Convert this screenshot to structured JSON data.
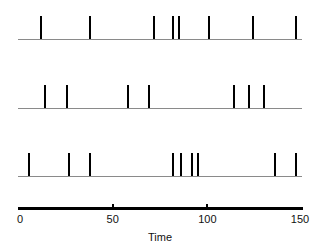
{
  "chart_data": {
    "type": "scatter",
    "plot_style": "raster / spike train",
    "title": "",
    "xlabel": "Time",
    "ylabel": "",
    "xlim": [
      0,
      150
    ],
    "xticks": [
      0,
      50,
      100,
      150
    ],
    "xticklabels": [
      "0",
      "50",
      "100",
      "150"
    ],
    "grid": false,
    "legend": null,
    "series": [
      {
        "name": "Trial 1",
        "row": 1,
        "values": [
          12,
          38,
          72,
          82,
          85,
          101,
          124,
          147
        ]
      },
      {
        "name": "Trial 2",
        "row": 2,
        "values": [
          14,
          26,
          58,
          69,
          114,
          122,
          130
        ]
      },
      {
        "name": "Trial 3",
        "row": 3,
        "values": [
          6,
          27,
          38,
          82,
          86,
          92,
          95,
          136,
          147
        ]
      }
    ],
    "colors": {
      "spike": "#000000",
      "baseline": "#8a8a8a",
      "axis": "#000000",
      "text": "#111111",
      "background": "#ffffff"
    }
  },
  "axis": {
    "title": "Time",
    "ticks": [
      {
        "label": "0",
        "value": 0
      },
      {
        "label": "50",
        "value": 50
      },
      {
        "label": "100",
        "value": 100
      },
      {
        "label": "150",
        "value": 150
      }
    ]
  }
}
